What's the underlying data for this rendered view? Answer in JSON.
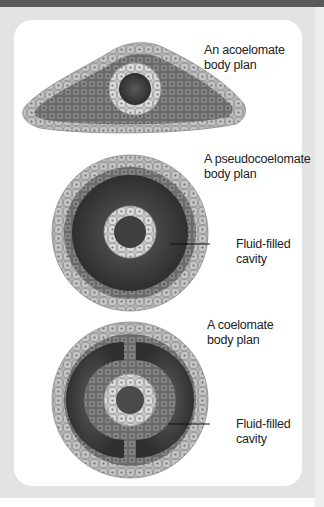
{
  "figure": {
    "panels": [
      {
        "id": "acoelomate",
        "label_line1": "An acoelomate",
        "label_line2": "body plan"
      },
      {
        "id": "pseudocoelomate",
        "label_line1": "A pseudocoelomate",
        "label_line2": "body plan",
        "callout_line1": "Fluid-filled",
        "callout_line2": "cavity"
      },
      {
        "id": "coelomate",
        "label_line1": "A coelomate",
        "label_line2": "body plan",
        "callout_line1": "Fluid-filled",
        "callout_line2": "cavity"
      }
    ],
    "colors": {
      "ectoderm": "#b9b9b9",
      "mesoderm": "#7d7d7d",
      "endoderm": "#d2d2d2",
      "cavity": "#3c3c3c",
      "gut": "#444444",
      "header_bar": "#5a5a5a",
      "frame": "#e3e3e3"
    }
  }
}
